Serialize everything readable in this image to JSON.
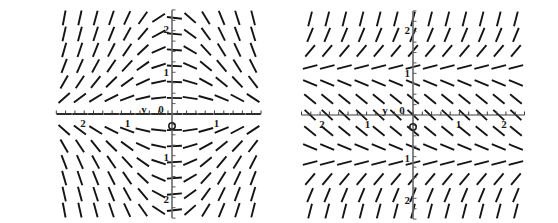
{
  "figure": {
    "background_color": "#ffffff",
    "stroke_color": "#141414",
    "panel_count": 2
  },
  "chart_data": [
    {
      "type": "scatter",
      "subtype": "slope-field",
      "title": "",
      "xlabel": "",
      "ylabel": "y",
      "origin_label": "0",
      "xlim": [
        -2.6,
        2.0
      ],
      "ylim": [
        -2.45,
        2.45
      ],
      "xticks": [
        -2,
        -1,
        0,
        1
      ],
      "xtick_labels": [
        "2",
        "1",
        "0",
        "1"
      ],
      "yticks": [
        2,
        1,
        0,
        -1,
        -2
      ],
      "ytick_labels": [
        "2",
        "1",
        "0",
        "1",
        "2"
      ],
      "grid": false,
      "legend": "none",
      "axis_arrow": false,
      "minor_tick_count_x": 22,
      "minor_tick_count_y": 20,
      "slope_formula": "dy/dx = -x*y",
      "segment_grid_x": 13,
      "segment_grid_y": 13,
      "segment_length": 15,
      "description": "Direction field with chevron shaped rows; slopes positive at left, flat near x=0, negative at right above the axis and mirrored below."
    },
    {
      "type": "scatter",
      "subtype": "slope-field",
      "title": "",
      "xlabel": "",
      "ylabel": "y",
      "origin_label": "0",
      "xlim": [
        -2.45,
        2.45
      ],
      "ylim": [
        -2.45,
        2.45
      ],
      "xticks": [
        -2,
        -1,
        0,
        1,
        2
      ],
      "xtick_labels": [
        "2",
        "1",
        "0",
        "1",
        "2"
      ],
      "yticks": [
        2,
        1,
        0,
        -1,
        -2
      ],
      "ytick_labels": [
        "2",
        "1",
        "0",
        "1",
        "2"
      ],
      "grid": false,
      "legend": "none",
      "axis_arrow": false,
      "minor_tick_count_x": 24,
      "minor_tick_count_y": 20,
      "slope_formula": "dy/dx = y*y - 1",
      "segment_grid_x": 13,
      "segment_grid_y": 13,
      "segment_length": 15,
      "description": "Direction field depending only on y; steep positive slopes above y=1, shallow near y=0, steep negative below y=-1, horizontal rows identical."
    }
  ],
  "panels": [
    {
      "name": "left-slope-field",
      "y_axis_symbol": "y",
      "origin_symbol": "0",
      "x_tick_texts": [
        "2",
        "1",
        "1"
      ],
      "y_tick_texts": [
        "2",
        "1",
        "1",
        "2"
      ]
    },
    {
      "name": "right-slope-field",
      "y_axis_symbol": "y",
      "origin_symbol": "0",
      "x_tick_texts": [
        "2",
        "1",
        "1",
        "2"
      ],
      "y_tick_texts": [
        "2",
        "1",
        "1",
        "2"
      ]
    }
  ]
}
